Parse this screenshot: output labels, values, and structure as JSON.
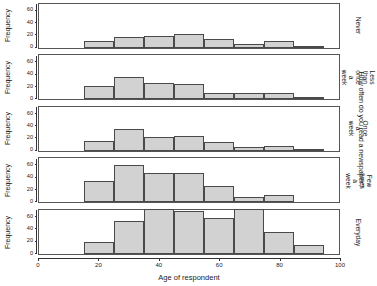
{
  "chart_data": {
    "type": "bar",
    "title": "How often do you read a newspaper?",
    "xlabel": "Age of respondent",
    "ylabel": "Frequency",
    "xlim": [
      0,
      100
    ],
    "ylim": [
      0,
      70
    ],
    "xticks": [
      0,
      20,
      40,
      60,
      80,
      100
    ],
    "yticks": [
      0,
      20,
      40,
      60
    ],
    "grid": false,
    "legend": null,
    "bin_width": 10,
    "bin_starts": [
      15,
      25,
      35,
      45,
      55,
      65,
      75,
      85
    ],
    "categories": [
      "15-25",
      "25-35",
      "35-45",
      "45-55",
      "55-65",
      "65-75",
      "75-85",
      "85-95"
    ],
    "panels": [
      {
        "label": "Never",
        "values": [
          11,
          17,
          18,
          21,
          13,
          5,
          10,
          2
        ]
      },
      {
        "label": "Less than once a week",
        "values": [
          21,
          35,
          25,
          24,
          9,
          10,
          10,
          3
        ]
      },
      {
        "label": "Once a week",
        "values": [
          15,
          34,
          21,
          23,
          13,
          6,
          7,
          2
        ]
      },
      {
        "label": "Few times a week",
        "values": [
          34,
          59,
          46,
          46,
          25,
          8,
          12,
          0
        ]
      },
      {
        "label": "Everyday",
        "values": [
          18,
          52,
          70,
          67,
          57,
          70,
          35,
          14
        ]
      }
    ],
    "colors": {
      "bar_fill": "#d2d2d2",
      "bar_stroke": "#4a4a4a",
      "panel_border": "#555555",
      "axis": "#333333",
      "background": "#ffffff"
    }
  }
}
